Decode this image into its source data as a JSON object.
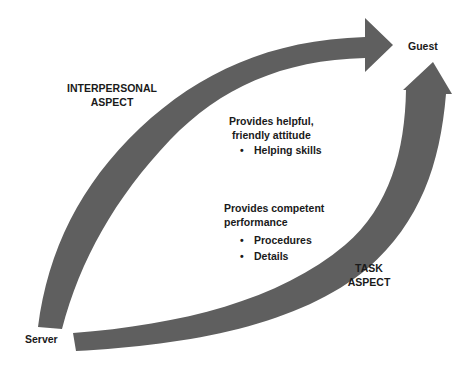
{
  "diagram": {
    "nodes": {
      "guest": "Guest",
      "server": "Server"
    },
    "arrows": {
      "interpersonal": {
        "label_line1": "INTERPERSONAL",
        "label_line2": "ASPECT",
        "description_line1": "Provides helpful,",
        "description_line2": "friendly attitude",
        "bullets": [
          "Helping skills"
        ]
      },
      "task": {
        "label_line1": "TASK",
        "label_line2": "ASPECT",
        "description_line1": "Provides competent",
        "description_line2": "performance",
        "bullets": [
          "Procedures",
          "Details"
        ]
      }
    },
    "bullet_glyph": "•",
    "colors": {
      "arrow_fill": "#5f5f5f",
      "text": "#1a1a1a",
      "background": "#ffffff"
    }
  }
}
